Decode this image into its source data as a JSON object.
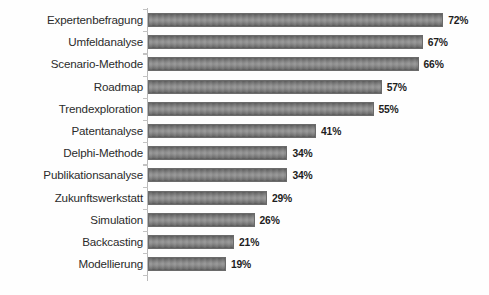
{
  "chart_data": {
    "type": "bar",
    "orientation": "horizontal",
    "title": "",
    "subtitle": "",
    "xlabel": "",
    "ylabel": "",
    "categories": [
      "Expertenbefragung",
      "Umfeldanalyse",
      "Scenario-Methode",
      "Roadmap",
      "Trendexploration",
      "Patentanalyse",
      "Delphi-Methode",
      "Publikationsanalyse",
      "Zukunftswerkstatt",
      "Simulation",
      "Backcasting",
      "Modellierung"
    ],
    "values": [
      72,
      67,
      66,
      57,
      55,
      41,
      34,
      34,
      29,
      26,
      21,
      19
    ],
    "value_labels": [
      "72%",
      "67%",
      "66%",
      "57%",
      "55%",
      "41%",
      "34%",
      "34%",
      "29%",
      "26%",
      "21%",
      "19%"
    ],
    "unit": "%",
    "xlim": [
      0,
      72
    ],
    "grid": false,
    "legend": false,
    "legend_position": "none",
    "axis_visible": {
      "category_axis": true,
      "value_axis": false
    },
    "tick_labels_x": [],
    "tick_labels_y": [
      "Expertenbefragung",
      "Umfeldanalyse",
      "Scenario-Methode",
      "Roadmap",
      "Trendexploration",
      "Patentanalyse",
      "Delphi-Methode",
      "Publikationsanalyse",
      "Zukunftswerkstatt",
      "Simulation",
      "Backcasting",
      "Modellierung"
    ],
    "annotations": []
  },
  "style": {
    "background": "#fefefe",
    "bar_fill": "#8a8a8a",
    "bar_edge": "#6b6b6b",
    "axis_color": "#b9b9b9",
    "label_color": "#2b2b2b",
    "value_color": "#1d1d1d"
  },
  "scale": {
    "px_per_percent": 4.1,
    "bar_origin_x": 148
  }
}
